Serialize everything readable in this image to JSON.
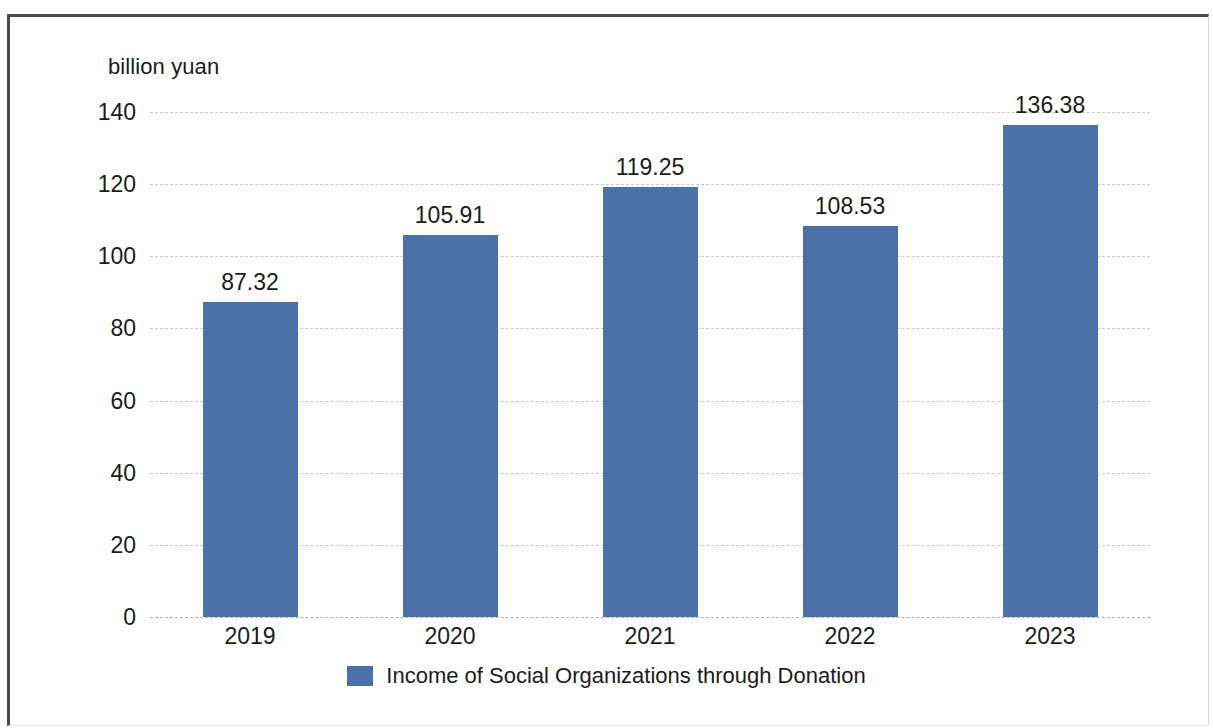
{
  "chart_data": {
    "type": "bar",
    "title": "",
    "subtitle": "",
    "xlabel": "",
    "ylabel": "billion yuan",
    "categories": [
      "2019",
      "2020",
      "2021",
      "2022",
      "2023"
    ],
    "values": [
      87.32,
      105.91,
      119.25,
      108.53,
      136.38
    ],
    "data_labels": [
      "87.32",
      "105.91",
      "119.25",
      "108.53",
      "136.38"
    ],
    "series": [
      {
        "name": "Income of Social Organizations through Donation",
        "values": [
          87.32,
          105.91,
          119.25,
          108.53,
          136.38
        ],
        "color": "#4a72a8"
      }
    ],
    "ylim": [
      0,
      140
    ],
    "yticks": [
      0,
      20,
      40,
      60,
      80,
      100,
      120,
      140
    ],
    "ytick_labels": [
      "0",
      "20",
      "40",
      "60",
      "80",
      "100",
      "120",
      "140"
    ],
    "grid": true,
    "grid_style": "dashed-horizontal",
    "legend": {
      "position": "bottom-center",
      "entries": [
        {
          "label": "Income of Social Organizations through Donation",
          "color": "#4a72a8"
        }
      ]
    },
    "colors": {
      "bar": "#4a72a8",
      "gridline": "#c9c9c9",
      "text": "#1b1b1b",
      "frame": "#4a4a4a",
      "background": "#ffffff"
    }
  }
}
